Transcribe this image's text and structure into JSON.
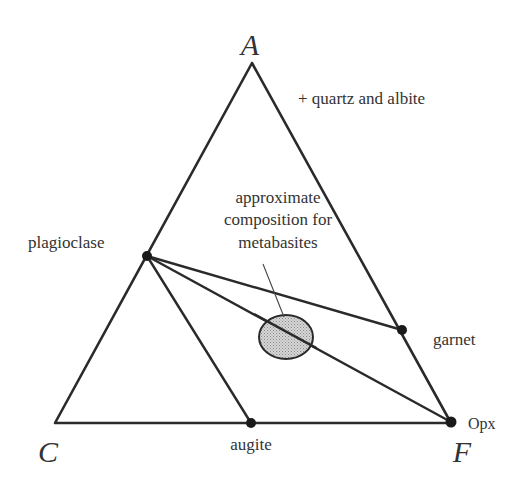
{
  "diagram": {
    "type": "ACF ternary diagram",
    "vertices": {
      "A": {
        "label": "A",
        "x": 252,
        "y": 63
      },
      "C": {
        "label": "C",
        "x": 55,
        "y": 423
      },
      "F": {
        "label": "F",
        "x": 451,
        "y": 423
      }
    },
    "annotation": "+ quartz and albite",
    "points": {
      "plagioclase": {
        "label": "plagioclase",
        "x": 147,
        "y": 256
      },
      "garnet": {
        "label": "garnet",
        "x": 402,
        "y": 330
      },
      "augite": {
        "label": "augite",
        "x": 251,
        "y": 423
      },
      "opx": {
        "label": "Opx",
        "x": 451,
        "y": 422
      }
    },
    "tie_lines": [
      [
        "plagioclase",
        "augite"
      ],
      [
        "plagioclase",
        "opx"
      ],
      [
        "plagioclase",
        "garnet"
      ]
    ],
    "field": {
      "label_lines": [
        "approximate",
        "composition for",
        "metabasites"
      ],
      "cx": 286,
      "cy": 337,
      "rx": 27,
      "ry": 22,
      "fill": "#c8c8c8"
    },
    "colors": {
      "line": "#2a2a2a",
      "text": "#333333",
      "field_fill": "#c8c8c8"
    }
  }
}
